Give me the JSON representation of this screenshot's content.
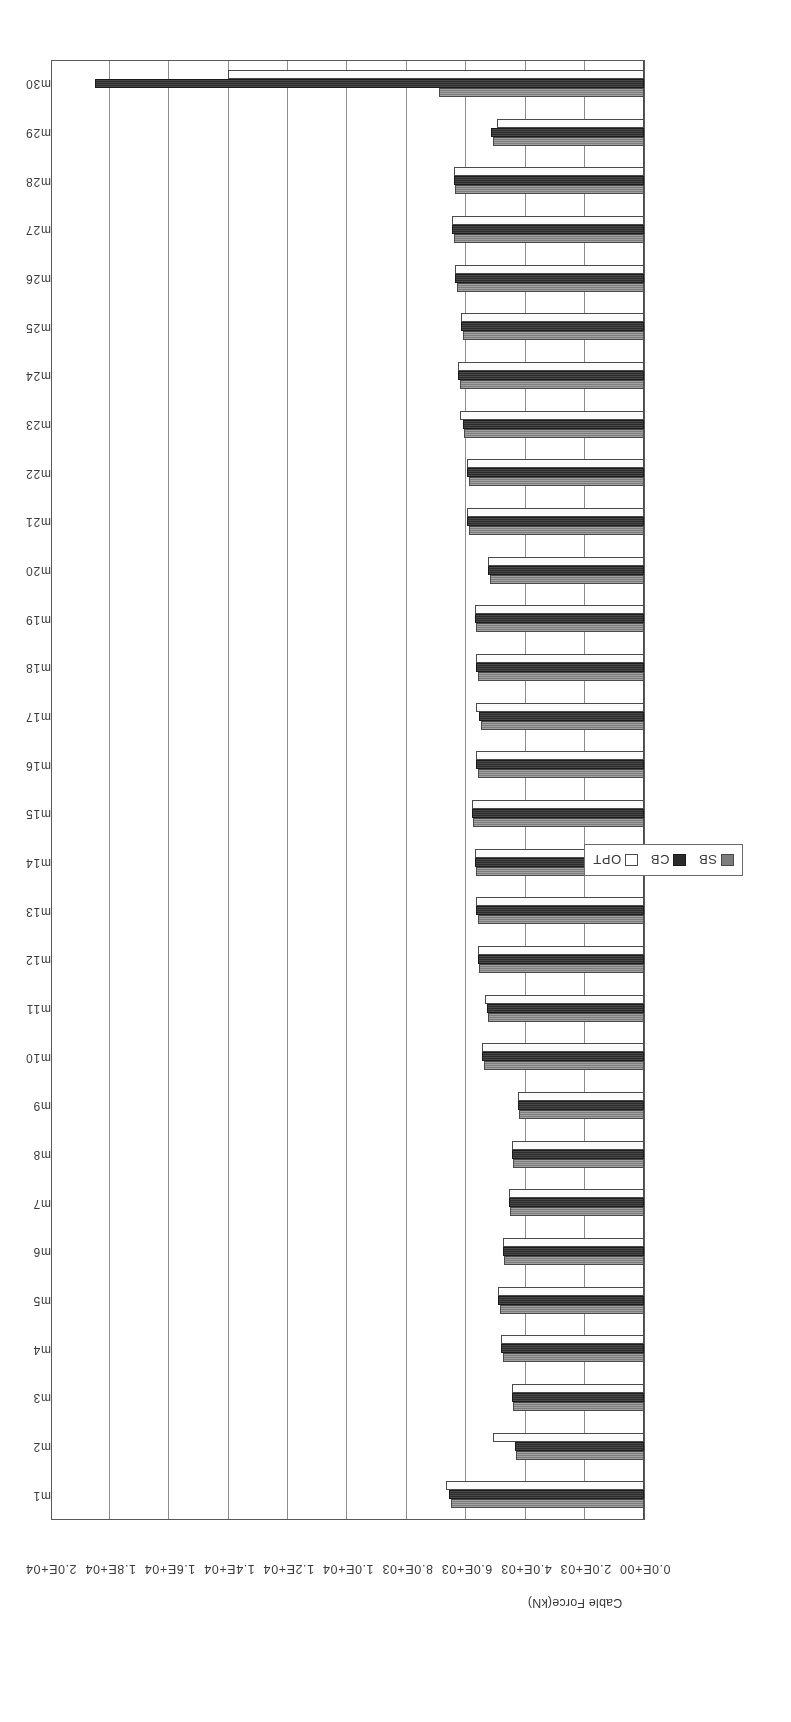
{
  "chart_data": {
    "type": "bar",
    "orientation": "horizontal",
    "title": "",
    "xlabel": "",
    "ylabel": "Cable Force(kN)",
    "value_axis_label": "Cable Force(kN)",
    "value_ticks": [
      "2.0E+04",
      "1.8E+04",
      "1.6E+04",
      "1.4E+04",
      "1.2E+04",
      "1.0E+04",
      "8.0E+03",
      "6.0E+03",
      "4.0E+03",
      "2.0E+03",
      "0.0E+00"
    ],
    "value_tick_numbers": [
      20000,
      18000,
      16000,
      14000,
      12000,
      10000,
      8000,
      6000,
      4000,
      2000,
      0
    ],
    "ylim": [
      0,
      20000
    ],
    "grid": true,
    "legend_position": "bottom-center",
    "rotation_deg": 180,
    "categories": [
      "m1",
      "m2",
      "m3",
      "m4",
      "m5",
      "m6",
      "m7",
      "m8",
      "m9",
      "m10",
      "m11",
      "m12",
      "m13",
      "m14",
      "m15",
      "m16",
      "m17",
      "m18",
      "m19",
      "m20",
      "m21",
      "m22",
      "m23",
      "m24",
      "m25",
      "m26",
      "m27",
      "m28",
      "m29",
      "m30"
    ],
    "series": [
      {
        "name": "SB",
        "color": "#7d7d7d",
        "values": [
          6500,
          4300,
          4400,
          4750,
          4850,
          4700,
          4500,
          4400,
          4200,
          5400,
          5250,
          5550,
          5600,
          5650,
          5750,
          5600,
          5500,
          5600,
          5650,
          5200,
          5900,
          5900,
          6050,
          6200,
          6100,
          6300,
          6400,
          6350,
          5100,
          6900
        ]
      },
      {
        "name": "CB",
        "color": "#2b2b2b",
        "values": [
          6550,
          4350,
          4450,
          4800,
          4900,
          4750,
          4550,
          4450,
          4250,
          5450,
          5300,
          5600,
          5650,
          5700,
          5800,
          5650,
          5550,
          5650,
          5700,
          5250,
          5950,
          5950,
          6100,
          6250,
          6150,
          6350,
          6450,
          6400,
          5150,
          18500
        ]
      },
      {
        "name": "OPT",
        "color": "#ffffff",
        "values": [
          6650,
          5100,
          4450,
          4800,
          4900,
          4750,
          4550,
          4450,
          4250,
          5450,
          5350,
          5600,
          5650,
          5700,
          5800,
          5650,
          5650,
          5650,
          5700,
          5250,
          5950,
          5950,
          6200,
          6250,
          6150,
          6350,
          6450,
          6400,
          4950,
          14000
        ]
      }
    ]
  },
  "legend": {
    "items": [
      {
        "label": "SB",
        "swatch": "sb"
      },
      {
        "label": "CB",
        "swatch": "cb"
      },
      {
        "label": "OPT",
        "swatch": "opt"
      }
    ]
  }
}
